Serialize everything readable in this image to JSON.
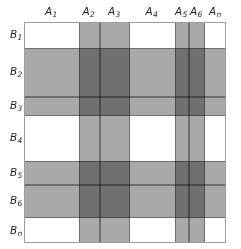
{
  "figure": {
    "name": "cross-classification-matrix",
    "colors": {
      "shade": "#a9a9a9",
      "overlap_shade": "#8b8b8b",
      "grid_line": "#6f6f6f",
      "outer_border": "#9c9c9c",
      "background": "#ffffff",
      "label": "#231f20"
    }
  },
  "columns": [
    {
      "id": "A1",
      "base": "A",
      "sub": "1",
      "x": 0,
      "width": 54,
      "shaded": false
    },
    {
      "id": "A2",
      "base": "A",
      "sub": "2",
      "x": 54,
      "width": 21,
      "shaded": true
    },
    {
      "id": "A3",
      "base": "A",
      "sub": "3",
      "x": 75,
      "width": 30,
      "shaded": true
    },
    {
      "id": "A4",
      "base": "A",
      "sub": "4",
      "x": 105,
      "width": 45,
      "shaded": false
    },
    {
      "id": "A5",
      "base": "A",
      "sub": "5",
      "x": 150,
      "width": 14,
      "shaded": true
    },
    {
      "id": "A6",
      "base": "A",
      "sub": "6",
      "x": 164,
      "width": 16,
      "shaded": true
    },
    {
      "id": "An",
      "base": "A",
      "sub": "n",
      "x": 180,
      "width": 22,
      "shaded": false
    }
  ],
  "rows": [
    {
      "id": "B1",
      "base": "B",
      "sub": "1",
      "y": 0,
      "height": 25,
      "shaded": false
    },
    {
      "id": "B2",
      "base": "B",
      "sub": "2",
      "y": 25,
      "height": 49,
      "shaded": true
    },
    {
      "id": "B3",
      "base": "B",
      "sub": "3",
      "y": 74,
      "height": 19,
      "shaded": true
    },
    {
      "id": "B4",
      "base": "B",
      "sub": "4",
      "y": 93,
      "height": 45,
      "shaded": false
    },
    {
      "id": "B5",
      "base": "B",
      "sub": "5",
      "y": 138,
      "height": 24,
      "shaded": true
    },
    {
      "id": "B6",
      "base": "B",
      "sub": "6",
      "y": 162,
      "height": 33,
      "shaded": true
    },
    {
      "id": "Bn",
      "base": "B",
      "sub": "n",
      "y": 195,
      "height": 26,
      "shaded": false
    }
  ]
}
